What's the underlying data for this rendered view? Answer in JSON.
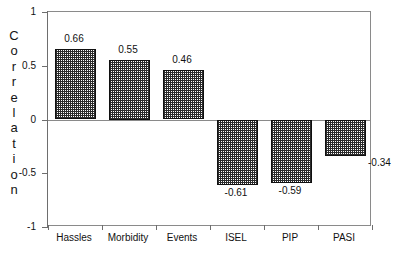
{
  "chart_data": {
    "type": "bar",
    "title": "",
    "xlabel": "",
    "ylabel": "Correlation",
    "categories": [
      "Hassles",
      "Morbidity",
      "Events",
      "ISEL",
      "PIP",
      "PASI"
    ],
    "values": [
      0.66,
      0.55,
      0.46,
      -0.61,
      -0.59,
      -0.34
    ],
    "value_labels": [
      "0.66",
      "0.55",
      "0.46",
      "-0.61",
      "-0.59",
      "-0.34"
    ],
    "ylim": [
      -1,
      1
    ],
    "yticks": [
      1,
      0.5,
      0,
      -0.5,
      -1
    ],
    "ytick_labels": [
      "1",
      "0.5",
      "0",
      "-0.5",
      "-1"
    ],
    "grid": false,
    "legend": null,
    "zero_line": 0,
    "bar_fill": "cross-hatch-dot-pattern",
    "bar_edge_color": "#101010",
    "frame_color": "#8a8a8a",
    "background": "#ffffff"
  },
  "axis": {
    "y_title_letters": [
      "C",
      "o",
      "r",
      "r",
      "e",
      "l",
      "a",
      "t",
      "i",
      "o",
      "n"
    ]
  }
}
